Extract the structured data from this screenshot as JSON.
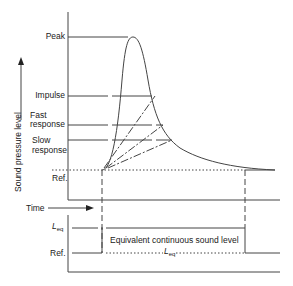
{
  "upper_panel": {
    "y_axis_label": "Sound pressure level",
    "x_axis_label": "Time",
    "levels": [
      {
        "id": "peak",
        "label": "Peak"
      },
      {
        "id": "impulse",
        "label": "Impulse"
      },
      {
        "id": "fast",
        "label_line1": "Fast",
        "label_line2": "response"
      },
      {
        "id": "slow",
        "label_line1": "Slow",
        "label_line2": "response"
      },
      {
        "id": "ref",
        "label": "Ref."
      }
    ]
  },
  "lower_panel": {
    "leq_label": "L",
    "leq_sub": "eq",
    "ref_label": "Ref.",
    "caption": "Equivalent continuous sound level",
    "caption_leq": "L",
    "caption_leq_sub": "eq"
  },
  "colors": {
    "line": "#444444",
    "text": "#222222",
    "background": "#ffffff"
  }
}
